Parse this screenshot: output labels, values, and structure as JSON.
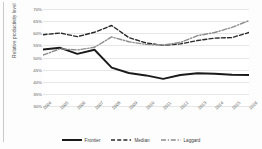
{
  "chart_data": {
    "type": "line",
    "title": "",
    "xlabel": "",
    "ylabel": "Relative productivity level",
    "ylim": [
      30,
      70
    ],
    "ytick_labels": [
      "70%",
      "65%",
      "60%",
      "55%",
      "50%",
      "45%",
      "40%",
      "35%",
      "30%"
    ],
    "ytick_values": [
      70,
      65,
      60,
      55,
      50,
      45,
      40,
      35,
      30
    ],
    "grid": true,
    "legend_position": "bottom",
    "x": [
      "2004",
      "2005",
      "2006",
      "2007",
      "2008",
      "2009",
      "2010",
      "2011",
      "2012",
      "2013",
      "2014",
      "2015",
      "2016"
    ],
    "categories": [
      "2004",
      "2005",
      "2006",
      "2007",
      "2008",
      "2009",
      "2010",
      "2011",
      "2012",
      "2013",
      "2014",
      "2015",
      "2016"
    ],
    "series": [
      {
        "name": "Frontier",
        "style": "solid",
        "color": "#1a1a1a",
        "values": [
          53.3,
          54.0,
          51.5,
          53.2,
          45.8,
          43.6,
          42.6,
          41.2,
          42.8,
          43.5,
          43.3,
          42.9,
          42.8
        ]
      },
      {
        "name": "Median",
        "style": "dashed",
        "color": "#2a2a2a",
        "values": [
          59.4,
          60.1,
          58.6,
          60.4,
          63.2,
          58.2,
          56.0,
          55.0,
          55.6,
          57.0,
          58.0,
          58.2,
          60.3
        ]
      },
      {
        "name": "Laggard",
        "style": "dashdot",
        "color": "#8c8c8c",
        "values": [
          51.0,
          53.6,
          53.1,
          54.2,
          58.5,
          56.5,
          55.4,
          55.1,
          56.2,
          59.0,
          60.3,
          62.4,
          65.2
        ]
      }
    ]
  },
  "legend": {
    "items": [
      {
        "label": "Frontier",
        "style": "solid",
        "color": "#1a1a1a"
      },
      {
        "label": "Median",
        "style": "dashed",
        "color": "#2a2a2a"
      },
      {
        "label": "Laggard",
        "style": "dashdot",
        "color": "#8c8c8c"
      }
    ]
  }
}
